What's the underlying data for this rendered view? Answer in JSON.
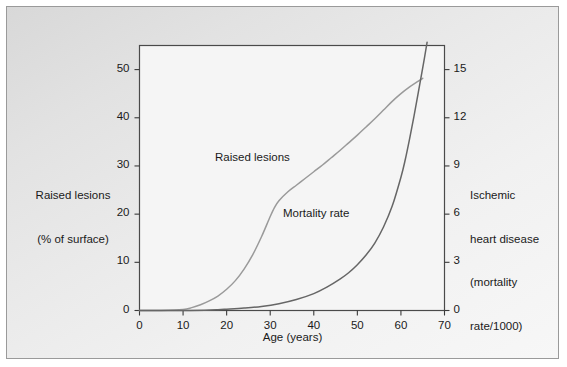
{
  "figure": {
    "background_color": "#ebebeb",
    "border_color": "#9a9a9a",
    "plot_background": "#f4f4f4"
  },
  "labels": {
    "left_axis_title_line1": "Raised lesions",
    "left_axis_title_line2": "(% of surface)",
    "right_axis_title_line1": "Ischemic",
    "right_axis_title_line2": "heart disease",
    "right_axis_title_line3": "(mortality",
    "right_axis_title_line4": "rate/1000)",
    "x_axis_title": "Age (years)",
    "series_raised_lesions": "Raised lesions",
    "series_mortality_rate": "Mortality rate"
  },
  "chart_data": {
    "type": "line",
    "title": "",
    "xlabel": "Age (years)",
    "ylabel": "Raised lesions (% of surface)",
    "y2label": "Ischemic heart disease (mortality rate/1000)",
    "xlim": [
      0,
      70
    ],
    "ylim": [
      0,
      55
    ],
    "y2lim": [
      0,
      16.5
    ],
    "xticks": [
      0,
      10,
      20,
      30,
      40,
      50,
      60,
      70
    ],
    "xtick_labels": [
      "0",
      "10",
      "20",
      "30",
      "40",
      "50",
      "60",
      "70"
    ],
    "yticks": [
      0,
      10,
      20,
      30,
      40,
      50
    ],
    "ytick_labels": [
      "0",
      "10",
      "20",
      "30",
      "40",
      "50"
    ],
    "y2ticks": [
      0,
      3,
      6,
      9,
      12,
      15
    ],
    "y2tick_labels": [
      "0",
      "3",
      "6",
      "9",
      "12",
      "15"
    ],
    "grid": false,
    "legend_position": "inline-annotations",
    "series": [
      {
        "name": "Raised lesions",
        "axis": "left",
        "color": "#9a9a9a",
        "units": "% of surface",
        "x": [
          0,
          5,
          10,
          12,
          14,
          16,
          18,
          20,
          22,
          24,
          26,
          28,
          30,
          31,
          32,
          34,
          36,
          38,
          40,
          42,
          44,
          46,
          48,
          50,
          52,
          54,
          56,
          58,
          60,
          62,
          64,
          65
        ],
        "values": [
          0,
          0,
          0.2,
          0.6,
          1.2,
          2.0,
          3.0,
          4.4,
          6.2,
          8.6,
          11.6,
          15.3,
          19.5,
          21.4,
          22.8,
          24.6,
          26.0,
          27.4,
          28.8,
          30.2,
          31.7,
          33.2,
          34.8,
          36.4,
          38.1,
          39.8,
          41.6,
          43.4,
          45.0,
          46.4,
          47.6,
          48.2
        ]
      },
      {
        "name": "Mortality rate",
        "axis": "right",
        "color": "#666666",
        "units": "mortality rate/1000",
        "x": [
          0,
          5,
          10,
          15,
          18,
          20,
          24,
          28,
          32,
          36,
          40,
          43,
          46,
          48,
          50,
          52,
          54,
          56,
          58,
          60,
          61,
          62,
          63,
          64,
          65,
          66
        ],
        "values": [
          0,
          0,
          0,
          0.02,
          0.05,
          0.08,
          0.15,
          0.25,
          0.42,
          0.68,
          1.05,
          1.45,
          1.95,
          2.35,
          2.85,
          3.45,
          4.2,
          5.2,
          6.5,
          8.3,
          9.4,
          10.7,
          12.1,
          13.6,
          15.1,
          16.7
        ]
      }
    ]
  },
  "axis_ticks": {
    "left": [
      {
        "label": "0"
      },
      {
        "label": "10"
      },
      {
        "label": "20"
      },
      {
        "label": "30"
      },
      {
        "label": "40"
      },
      {
        "label": "50"
      }
    ],
    "right": [
      {
        "label": "0"
      },
      {
        "label": "3"
      },
      {
        "label": "6"
      },
      {
        "label": "9"
      },
      {
        "label": "12"
      },
      {
        "label": "15"
      }
    ],
    "bottom": [
      {
        "label": "0"
      },
      {
        "label": "10"
      },
      {
        "label": "20"
      },
      {
        "label": "30"
      },
      {
        "label": "40"
      },
      {
        "label": "50"
      },
      {
        "label": "60"
      },
      {
        "label": "70"
      }
    ]
  }
}
